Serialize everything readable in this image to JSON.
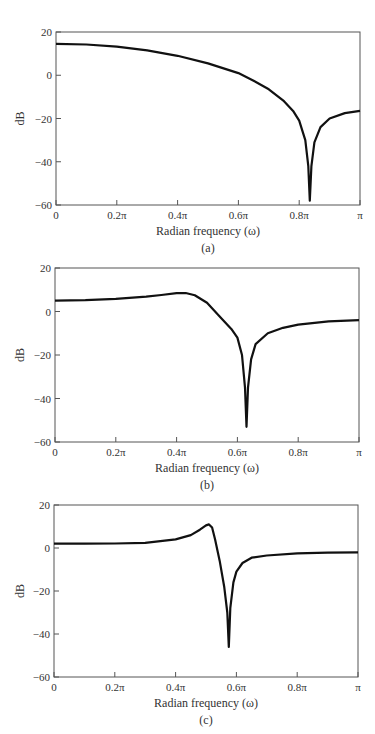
{
  "chart_data": [
    {
      "type": "line",
      "panel": "(a)",
      "title": "",
      "xlabel": "Radian frequency (ω)",
      "ylabel": "dB",
      "xlim": [
        0,
        1
      ],
      "x_units": "π",
      "ylim": [
        -60,
        20
      ],
      "x_ticks": [
        "0",
        "0.2π",
        "0.4π",
        "0.6π",
        "0.8π",
        "π"
      ],
      "y_ticks": [
        "20",
        "0",
        "−20",
        "−40",
        "−60"
      ],
      "grid": false,
      "series": [
        {
          "name": "magnitude response",
          "x": [
            0,
            0.1,
            0.2,
            0.3,
            0.4,
            0.5,
            0.6,
            0.65,
            0.7,
            0.75,
            0.78,
            0.8,
            0.82,
            0.83,
            0.835,
            0.84,
            0.85,
            0.87,
            0.9,
            0.95,
            1.0
          ],
          "values": [
            14.5,
            14.2,
            13.2,
            11.5,
            9,
            5.5,
            1,
            -2.5,
            -6.5,
            -12,
            -16.5,
            -21,
            -30,
            -42,
            -58,
            -42,
            -31,
            -24,
            -20,
            -17.5,
            -16.5
          ]
        }
      ],
      "notch": {
        "x": 0.835,
        "y": -58
      }
    },
    {
      "type": "line",
      "panel": "(b)",
      "title": "",
      "xlabel": "Radian frequency (ω)",
      "ylabel": "dB",
      "xlim": [
        0,
        1
      ],
      "x_units": "π",
      "ylim": [
        -60,
        20
      ],
      "x_ticks": [
        "0",
        "0.2π",
        "0.4π",
        "0.6π",
        "0.8π",
        "π"
      ],
      "y_ticks": [
        "20",
        "0",
        "−20",
        "−40",
        "−60"
      ],
      "grid": false,
      "series": [
        {
          "name": "magnitude response",
          "x": [
            0,
            0.1,
            0.2,
            0.3,
            0.35,
            0.4,
            0.43,
            0.46,
            0.5,
            0.54,
            0.58,
            0.6,
            0.615,
            0.625,
            0.63,
            0.635,
            0.645,
            0.66,
            0.7,
            0.75,
            0.8,
            0.9,
            1.0
          ],
          "values": [
            5,
            5.2,
            5.8,
            6.8,
            7.6,
            8.4,
            8.5,
            7.5,
            4,
            -2,
            -8,
            -12,
            -20,
            -35,
            -53,
            -35,
            -22,
            -15,
            -10,
            -7.5,
            -6,
            -4.5,
            -4
          ]
        }
      ],
      "notch": {
        "x": 0.63,
        "y": -53
      },
      "peak": {
        "x": 0.43,
        "y": 8.5
      }
    },
    {
      "type": "line",
      "panel": "(c)",
      "title": "",
      "xlabel": "Radian frequency (ω)",
      "ylabel": "dB",
      "xlim": [
        0,
        1
      ],
      "x_units": "π",
      "ylim": [
        -60,
        20
      ],
      "x_ticks": [
        "0",
        "0.2π",
        "0.4π",
        "0.6π",
        "0.8π",
        "π"
      ],
      "y_ticks": [
        "20",
        "0",
        "−20",
        "−40",
        "−60"
      ],
      "grid": false,
      "series": [
        {
          "name": "magnitude response",
          "x": [
            0,
            0.1,
            0.2,
            0.3,
            0.4,
            0.45,
            0.48,
            0.5,
            0.51,
            0.52,
            0.53,
            0.545,
            0.56,
            0.57,
            0.575,
            0.58,
            0.59,
            0.6,
            0.62,
            0.65,
            0.7,
            0.8,
            0.9,
            1.0
          ],
          "values": [
            2,
            2,
            2.1,
            2.4,
            4,
            6,
            8.5,
            10.5,
            11,
            9.5,
            4,
            -6,
            -18,
            -30,
            -46,
            -28,
            -16,
            -11,
            -7,
            -4.5,
            -3.5,
            -2.5,
            -2.2,
            -2
          ]
        }
      ],
      "notch": {
        "x": 0.575,
        "y": -46
      },
      "peak": {
        "x": 0.51,
        "y": 11
      }
    }
  ],
  "panels": [
    {
      "caption": "(a)",
      "ylabel": "dB",
      "xlabel": "Radian frequency (ω)"
    },
    {
      "caption": "(b)",
      "ylabel": "dB",
      "xlabel": "Radian frequency (ω)"
    },
    {
      "caption": "(c)",
      "ylabel": "dB",
      "xlabel": "Radian frequency (ω)"
    }
  ]
}
